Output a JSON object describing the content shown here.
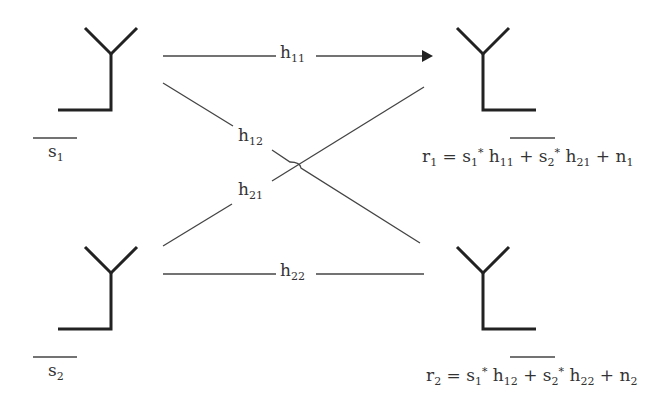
{
  "diagram": {
    "type": "MIMO 2x2 channel",
    "transmitters": [
      {
        "id": "tx1",
        "symbol": "s",
        "sub": "1"
      },
      {
        "id": "tx2",
        "symbol": "s",
        "sub": "2"
      }
    ],
    "receivers": [
      {
        "id": "rx1",
        "equation": {
          "lhs": "r",
          "lhs_sub": "1",
          "t1": "s",
          "t1_sub": "1",
          "t1_sup": "*",
          "h1": "h",
          "h1_sub": "11",
          "t2": "s",
          "t2_sub": "2",
          "t2_sup": "*",
          "h2": "h",
          "h2_sub": "21",
          "n": "n",
          "n_sub": "1"
        }
      },
      {
        "id": "rx2",
        "equation": {
          "lhs": "r",
          "lhs_sub": "2",
          "t1": "s",
          "t1_sub": "1",
          "t1_sup": "*",
          "h1": "h",
          "h1_sub": "12",
          "t2": "s",
          "t2_sub": "2",
          "t2_sup": "*",
          "h2": "h",
          "h2_sub": "22",
          "n": "n",
          "n_sub": "2"
        }
      }
    ],
    "channels": [
      {
        "label": "h",
        "sub": "11",
        "from": "tx1",
        "to": "rx1",
        "arrow": true
      },
      {
        "label": "h",
        "sub": "12",
        "from": "tx1",
        "to": "rx2",
        "arrow": false
      },
      {
        "label": "h",
        "sub": "21",
        "from": "tx2",
        "to": "rx1",
        "arrow": false
      },
      {
        "label": "h",
        "sub": "22",
        "from": "tx2",
        "to": "rx2",
        "arrow": false
      }
    ],
    "ops": {
      "eq": "=",
      "plus": "+"
    },
    "colors": {
      "line": "#333333",
      "antenna": "#222222",
      "background": "#ffffff"
    }
  }
}
